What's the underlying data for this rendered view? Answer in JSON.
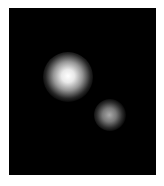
{
  "image": {
    "background": "#ffffff",
    "frame_color": "#000000",
    "spots": [
      {
        "label": "bright-spot",
        "center": [
          68,
          77
        ],
        "peak_color": "#ffffff"
      },
      {
        "label": "dim-spot",
        "center": [
          110,
          115
        ],
        "peak_color": "#aaaaaa"
      }
    ]
  }
}
